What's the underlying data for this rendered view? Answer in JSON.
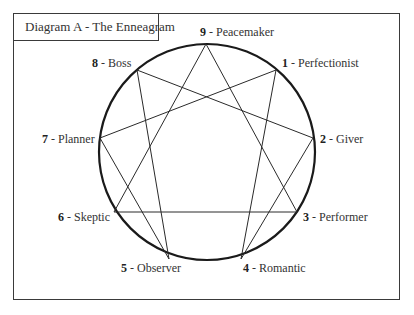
{
  "diagram": {
    "title": "Diagram A - The Enneagram",
    "circle": {
      "cx": 207,
      "cy": 152,
      "r": 108,
      "stroke": "#1a1a1a"
    },
    "points": [
      {
        "num": "9",
        "sep": " - ",
        "name": "Peacemaker",
        "x": 206,
        "y": 44
      },
      {
        "num": "1",
        "sep": " - ",
        "name": "Perfectionist",
        "x": 276,
        "y": 70
      },
      {
        "num": "2",
        "sep": " - ",
        "name": "Giver",
        "x": 313,
        "y": 138
      },
      {
        "num": "3",
        "sep": " - ",
        "name": "Performer",
        "x": 297,
        "y": 212
      },
      {
        "num": "4",
        "sep": " - ",
        "name": "Romantic",
        "x": 241,
        "y": 259
      },
      {
        "num": "5",
        "sep": " - ",
        "name": "Observer",
        "x": 169,
        "y": 259
      },
      {
        "num": "6",
        "sep": " - ",
        "name": "Skeptic",
        "x": 114,
        "y": 212
      },
      {
        "num": "7",
        "sep": " - ",
        "name": "Planner",
        "x": 100,
        "y": 138
      },
      {
        "num": "8",
        "sep": " - ",
        "name": "Boss",
        "x": 137,
        "y": 70
      }
    ],
    "edges": [
      [
        "9",
        "3"
      ],
      [
        "3",
        "6"
      ],
      [
        "6",
        "9"
      ],
      [
        "1",
        "4"
      ],
      [
        "4",
        "2"
      ],
      [
        "2",
        "8"
      ],
      [
        "8",
        "5"
      ],
      [
        "5",
        "7"
      ],
      [
        "7",
        "1"
      ]
    ]
  }
}
